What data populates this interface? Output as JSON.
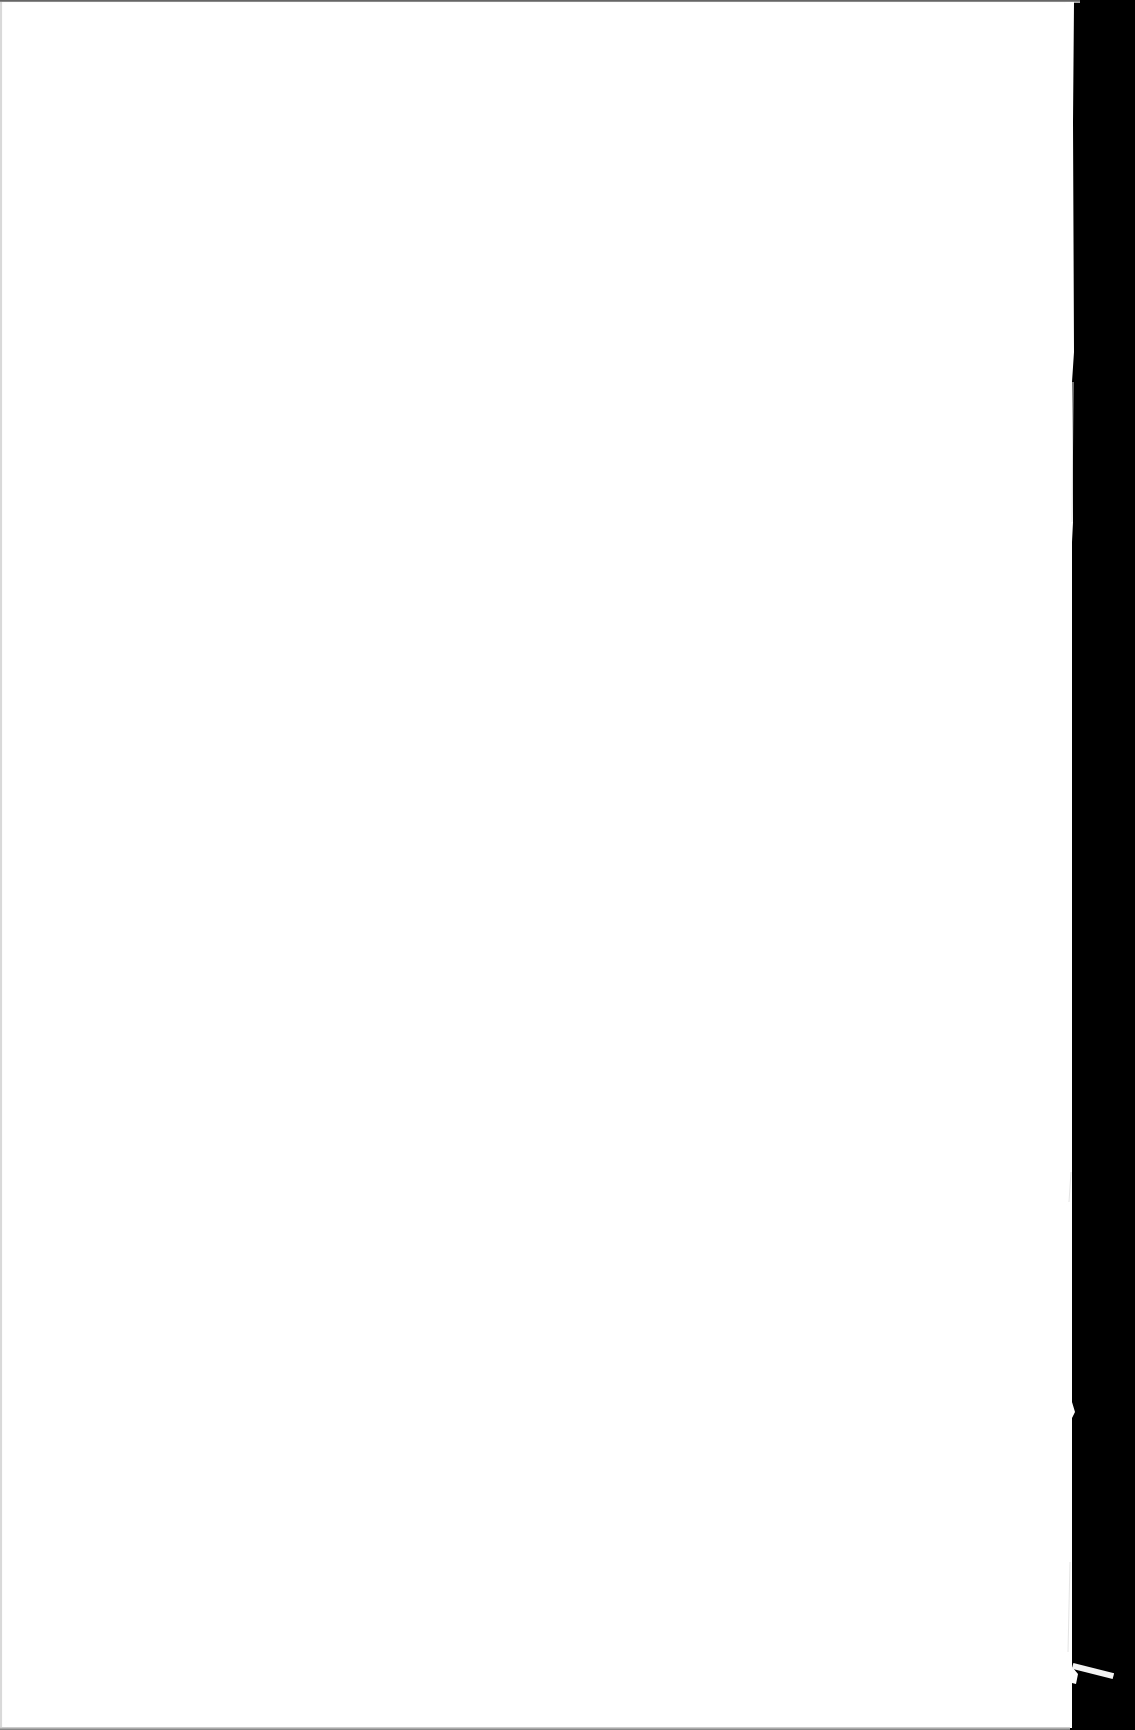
{
  "document": {
    "type": "scanned-page",
    "content_text": "",
    "colors": {
      "paper": "#ffffff",
      "background": "#000000"
    }
  }
}
